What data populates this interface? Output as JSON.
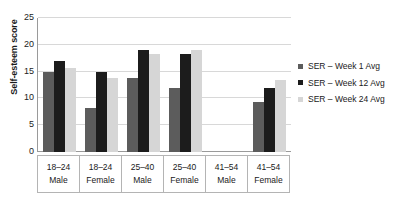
{
  "chart_data": {
    "type": "bar",
    "title": "",
    "xlabel": "",
    "ylabel": "Self-esteem score",
    "ylim": [
      0,
      25
    ],
    "yticks": [
      0,
      5,
      10,
      15,
      20,
      25
    ],
    "grid": true,
    "legend_position": "right",
    "categories": [
      {
        "age": "18–24",
        "sex": "Male"
      },
      {
        "age": "18–24",
        "sex": "Female"
      },
      {
        "age": "25–40",
        "sex": "Male"
      },
      {
        "age": "25–40",
        "sex": "Female"
      },
      {
        "age": "41–54",
        "sex": "Male"
      },
      {
        "age": "41–54",
        "sex": "Female"
      }
    ],
    "category_labels": [
      "18–24 Male",
      "18–24 Female",
      "25–40 Male",
      "25–40 Female",
      "41–54 Male",
      "41–54 Female"
    ],
    "series": [
      {
        "name": "SER – Week 1 Avg",
        "color": "#5c5c5c",
        "values": [
          15.0,
          8.3,
          13.8,
          12.0,
          null,
          9.3
        ]
      },
      {
        "name": "SER – Week 12 Avg",
        "color": "#1c1c1c",
        "values": [
          17.0,
          15.0,
          19.0,
          18.2,
          null,
          12.0
        ]
      },
      {
        "name": "SER – Week 24 Avg",
        "color": "#d6d6d6",
        "values": [
          15.7,
          13.8,
          18.3,
          19.0,
          null,
          13.5
        ]
      }
    ]
  },
  "legend": {
    "items": [
      {
        "label": "SER – Week 1 Avg",
        "color": "#5c5c5c"
      },
      {
        "label": "SER – Week 12 Avg",
        "color": "#1c1c1c"
      },
      {
        "label": "SER – Week 24 Avg",
        "color": "#d6d6d6"
      }
    ]
  }
}
